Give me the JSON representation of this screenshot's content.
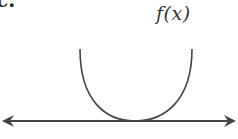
{
  "diagram": {
    "corner_fragment": "c.",
    "function_label": "f(x)",
    "colors": {
      "stroke": "#444444",
      "text": "#333333",
      "background": "#ffffff"
    }
  }
}
